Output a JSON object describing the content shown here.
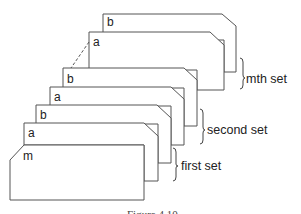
{
  "diagram": {
    "type": "stacked-card-sets",
    "cards": [
      {
        "id": "mth-b",
        "label": "b",
        "set": "mth"
      },
      {
        "id": "mth-a",
        "label": "a",
        "set": "mth"
      },
      {
        "id": "second-b",
        "label": "b",
        "set": "second"
      },
      {
        "id": "second-a",
        "label": "a",
        "set": "second"
      },
      {
        "id": "first-b",
        "label": "b",
        "set": "first"
      },
      {
        "id": "first-a",
        "label": "a",
        "set": "first"
      },
      {
        "id": "m",
        "label": "m",
        "set": "header"
      }
    ],
    "sets": [
      {
        "label": "mth set"
      },
      {
        "label": "second set"
      },
      {
        "label": "first set"
      }
    ],
    "ellipsis": "dashed connector between second set and mth set",
    "caption": "Figure 4.10"
  }
}
